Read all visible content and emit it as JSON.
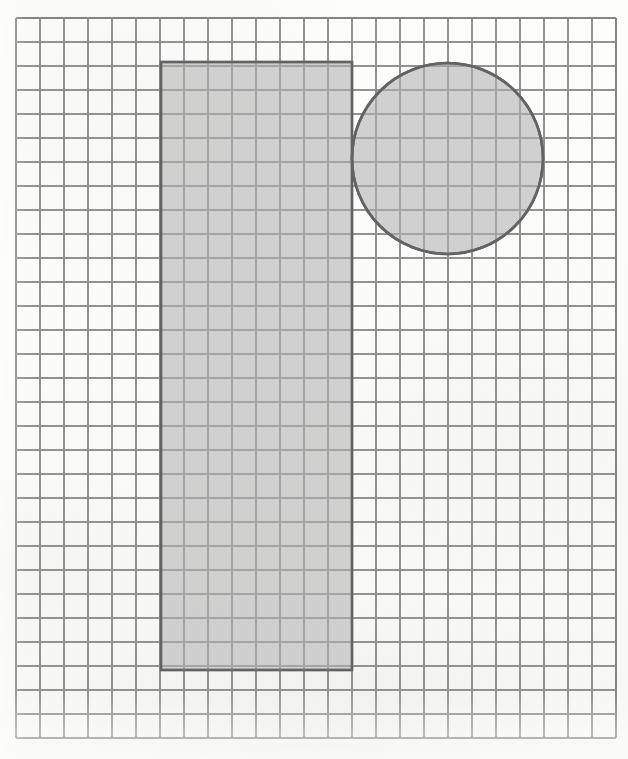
{
  "figure": {
    "title": "Shaded rectangle and circle on square grid paper",
    "background_color": "#fcfcfa",
    "canvas": {
      "width": 628,
      "height": 759
    }
  },
  "grid": {
    "name": "square-grid-paper",
    "origin_x": 16,
    "origin_y": 18,
    "cell_size": 24,
    "columns": 25,
    "rows": 30,
    "right_edge": 616,
    "bottom_edge": 738,
    "line_color": "#8a8a8a",
    "line_width": 1.6,
    "border_color": "#7a7a7a"
  },
  "shapes": [
    {
      "name": "shaded-rectangle",
      "type": "rect",
      "x": 161,
      "y": 62,
      "width": 191,
      "height": 608,
      "width_cells": 8,
      "height_cells": 25,
      "fill": "#c9c9c9",
      "stroke": "#636363",
      "stroke_width": 2.4
    },
    {
      "name": "shaded-circle",
      "type": "circle",
      "cx": 447.5,
      "cy": 158.5,
      "r": 95.5,
      "diameter_cells": 8,
      "fill": "#c9c9c9",
      "stroke": "#636363",
      "stroke_width": 2.6
    }
  ],
  "chart_data": {
    "type": "diagram",
    "title": "Shaded rectangle and circle on square grid paper",
    "grid": {
      "cell_size_px": 24,
      "columns": 25,
      "rows": 30,
      "x_range_px": [
        16,
        616
      ],
      "y_range_px": [
        18,
        738
      ]
    },
    "items": [
      {
        "label": "rectangle",
        "shape": "rectangle",
        "left_cell": 6,
        "top_cell": 2,
        "width_cells": 8,
        "height_cells": 25,
        "area_cells": 200,
        "fill": "gray",
        "outline": "dark gray"
      },
      {
        "label": "circle",
        "shape": "circle",
        "center_cell_x": 18,
        "center_cell_y": 6,
        "radius_cells": 4,
        "diameter_cells": 8,
        "fill": "gray",
        "outline": "dark gray"
      }
    ],
    "annotations": [],
    "legend": []
  }
}
